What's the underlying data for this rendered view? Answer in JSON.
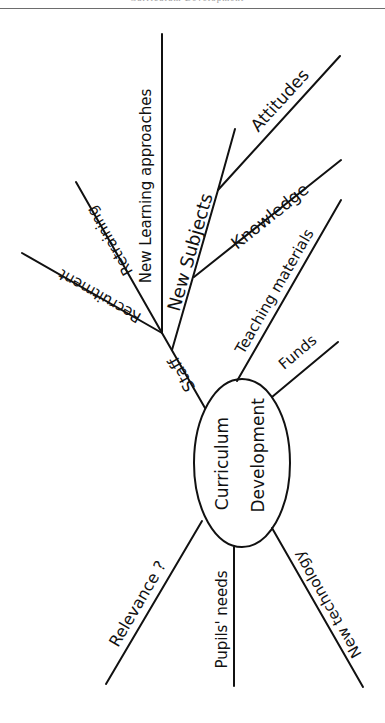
{
  "header": {
    "title": "Curriculum Development"
  },
  "diagram": {
    "center": {
      "line1": "Curriculum",
      "line2": "Development"
    },
    "branches": {
      "staff": "Staff",
      "recruitment": "Recruitment",
      "retraining": "Retraining",
      "new_learning_approaches": "New Learning approaches",
      "new_subjects": "New Subjects",
      "attitudes": "Attitudes",
      "knowledge": "Knowledge",
      "teaching_materials": "Teaching materials",
      "funds": "Funds",
      "relevance": "Relevance ?",
      "pupils_needs": "Pupils' needs",
      "new_technology": "New technology"
    },
    "colors": {
      "ink": "#111111",
      "paper": "#ffffff",
      "rule": "#6d6d6d"
    }
  }
}
